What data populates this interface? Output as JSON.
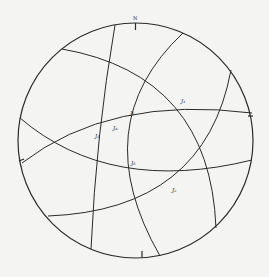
{
  "diagram": {
    "type": "stereographic-projection",
    "north_label": "N",
    "colors": {
      "background": "#f4f4f2",
      "ink": "#2a2a2a"
    },
    "joint_labels": [
      {
        "id": "J1",
        "text": "J₁",
        "x": 181,
        "y": 103
      },
      {
        "id": "J5",
        "text": "J₅",
        "x": 130,
        "y": 115
      },
      {
        "id": "J4",
        "text": "J₄",
        "x": 113,
        "y": 130
      },
      {
        "id": "J3",
        "text": "J₃",
        "x": 95,
        "y": 138
      },
      {
        "id": "J6",
        "text": "J₆",
        "x": 131,
        "y": 165
      },
      {
        "id": "J2",
        "text": "J₂",
        "x": 172,
        "y": 192
      }
    ]
  }
}
